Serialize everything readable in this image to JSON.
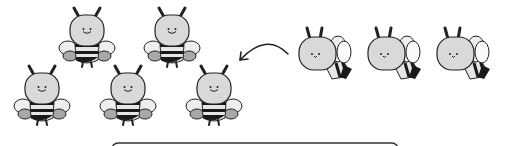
{
  "scene": {
    "title": "Bees joining a group",
    "colors": {
      "head": "#d9d9d9",
      "outline": "#222222",
      "wing_light": "#eeeeee",
      "wing_dark": "#a8a8a8",
      "body_stripe": "#1a1a1a",
      "body_light": "#e6e6e6",
      "background": "#ffffff"
    },
    "group_bees": [
      {
        "x": 87,
        "y": 30
      },
      {
        "x": 172,
        "y": 30
      },
      {
        "x": 42,
        "y": 88
      },
      {
        "x": 128,
        "y": 88
      },
      {
        "x": 214,
        "y": 88
      }
    ],
    "flying_bees": [
      {
        "x": 318,
        "y": 55
      },
      {
        "x": 387,
        "y": 55
      },
      {
        "x": 456,
        "y": 55
      }
    ],
    "arrow": {
      "direction": "left",
      "icon": "curved-arrow-icon"
    },
    "answer_box": {
      "text": ""
    }
  }
}
